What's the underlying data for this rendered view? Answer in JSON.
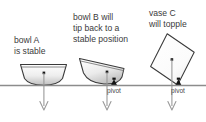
{
  "figure": {
    "type": "physics-stability-diagram",
    "background": "#ffffff",
    "ground_color": "#8c8c8c",
    "outline_color": "#3a3a3a",
    "text_color": "#3b3b3b",
    "arrow_color": "#9a9a9a",
    "pivot_color": "#1a1a1a",
    "ground_y": 85
  },
  "captions": {
    "a": {
      "line1": "bowl A",
      "line2": "is stable"
    },
    "b": {
      "line1": "bowl B will",
      "line2": "tip back to a",
      "line3": "stable position"
    },
    "c": {
      "line1": "vase C",
      "line2": "will topple"
    }
  },
  "labels": {
    "pivot_b": "pivot",
    "pivot_c": "pivot"
  },
  "objects": [
    {
      "id": "bowl-a",
      "name": "bowl A",
      "state": "stable",
      "tilt_deg": 0,
      "com": {
        "x": 44,
        "y": 73
      },
      "has_pivot": false
    },
    {
      "id": "bowl-b",
      "name": "bowl B",
      "state": "tips back to a stable position",
      "tilt_deg": 18,
      "com": {
        "x": 107,
        "y": 72
      },
      "has_pivot": true,
      "pivot": {
        "x": 114,
        "y": 85
      }
    },
    {
      "id": "vase-c",
      "name": "vase C",
      "state": "will topple",
      "tilt_deg": 35,
      "com": {
        "x": 172,
        "y": 60
      },
      "has_pivot": true,
      "pivot": {
        "x": 178,
        "y": 85
      }
    }
  ]
}
